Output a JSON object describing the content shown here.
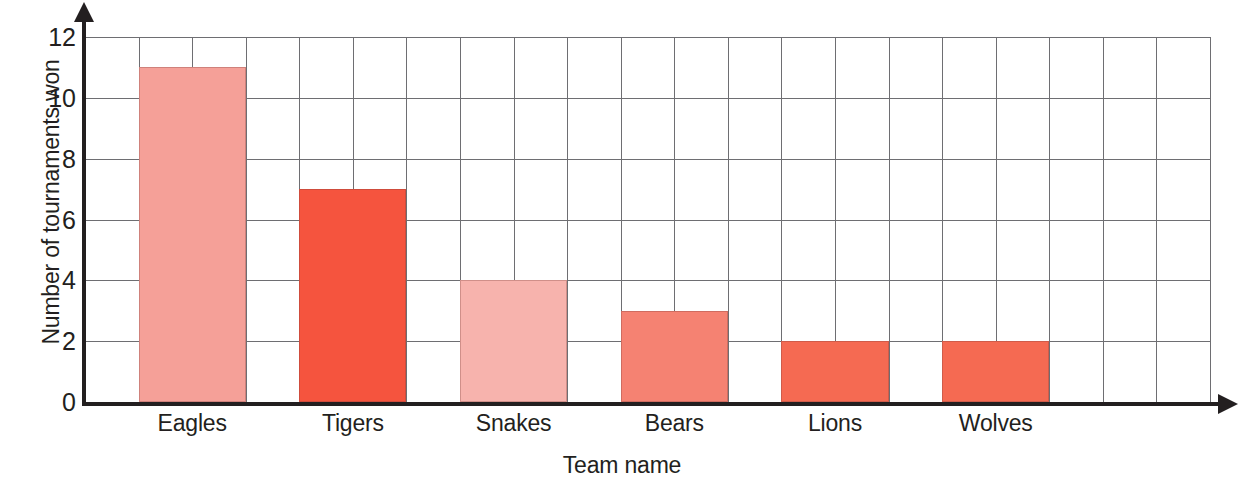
{
  "chart_data": {
    "type": "bar",
    "title": "",
    "xlabel": "Team name",
    "ylabel": "Number of tournaments won",
    "categories": [
      "Eagles",
      "Tigers",
      "Snakes",
      "Bears",
      "Lions",
      "Wolves"
    ],
    "values": [
      11,
      7,
      4,
      3,
      2,
      2
    ],
    "series": [
      {
        "name": "Number of tournaments won",
        "values": [
          11,
          7,
          4,
          3,
          2,
          2
        ]
      }
    ],
    "bar_colors": [
      "#f5a098",
      "#f5543e",
      "#f7b3ad",
      "#f58272",
      "#f56a52",
      "#f56a52"
    ],
    "ylim": [
      0,
      12
    ],
    "y_ticks": [
      0,
      2,
      4,
      6,
      8,
      10,
      12
    ],
    "y_tick_labels": [
      "0",
      "2",
      "4",
      "6",
      "8",
      "10",
      "12"
    ],
    "x_tick_labels": [
      "Eagles",
      "Tigers",
      "Snakes",
      "Bears",
      "Lions",
      "Wolves"
    ],
    "grid": "both",
    "gridline_color": "#6e6e72",
    "axis_color": "#231f20",
    "legend": "none",
    "legend_position": "none",
    "annotations": []
  }
}
